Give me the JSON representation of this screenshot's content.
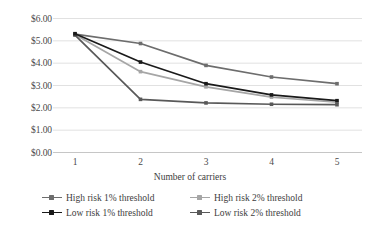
{
  "chart_data": {
    "type": "line",
    "title": "",
    "xlabel": "Number of carriers",
    "ylabel": "",
    "categories": [
      "1",
      "2",
      "3",
      "4",
      "5"
    ],
    "x": [
      1,
      2,
      3,
      4,
      5
    ],
    "ylim": [
      0,
      6
    ],
    "ytick_labels": [
      "$0.00",
      "$1.00",
      "$2.00",
      "$3.00",
      "$4.00",
      "$5.00",
      "$6.00"
    ],
    "ytick_values": [
      0,
      1,
      2,
      3,
      4,
      5,
      6
    ],
    "xtick_labels": [
      "1",
      "2",
      "3",
      "4",
      "5"
    ],
    "grid": "horizontal",
    "legend_position": "bottom",
    "value_prefix": "$",
    "series": [
      {
        "name": "High risk 1% threshold",
        "values": [
          5.3,
          4.88,
          3.9,
          3.38,
          3.08
        ],
        "color": "#6d6d6d",
        "marker": "square"
      },
      {
        "name": "High risk 2% threshold",
        "values": [
          5.28,
          3.62,
          2.94,
          2.48,
          2.25
        ],
        "color": "#a6a6a6",
        "marker": "square"
      },
      {
        "name": "Low risk 1% threshold",
        "values": [
          5.32,
          4.05,
          3.08,
          2.58,
          2.32
        ],
        "color": "#1a1a1a",
        "marker": "square"
      },
      {
        "name": "Low risk 2% threshold",
        "values": [
          5.26,
          2.38,
          2.22,
          2.16,
          2.14
        ],
        "color": "#595959",
        "marker": "square"
      }
    ]
  },
  "legend": {
    "items": [
      {
        "label": "High risk 1% threshold"
      },
      {
        "label": "High risk 2% threshold"
      },
      {
        "label": "Low risk 1% threshold"
      },
      {
        "label": "Low risk 2% threshold"
      }
    ]
  },
  "style": {
    "grid_color": "#d9d9d9",
    "axis_color": "#bfbfbf",
    "text_color": "#3d3d3d",
    "background": "#ffffff"
  }
}
